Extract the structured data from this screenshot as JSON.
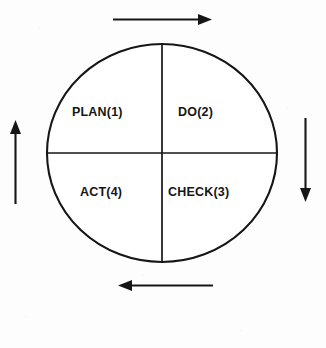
{
  "diagram": {
    "type": "pdca-cycle",
    "title": "",
    "shape": "ellipse",
    "rotation_direction": "clockwise",
    "stroke_color": "#161616",
    "fill_color": "#ffffff",
    "background_color": "#fdfdfd",
    "quadrants": [
      {
        "id": "plan",
        "label": "PLAN(1)",
        "step": 1,
        "position": "top-left"
      },
      {
        "id": "do",
        "label": "DO(2)",
        "step": 2,
        "position": "top-right"
      },
      {
        "id": "check",
        "label": "CHECK(3)",
        "step": 3,
        "position": "bottom-right"
      },
      {
        "id": "act",
        "label": "ACT(4)",
        "step": 4,
        "position": "bottom-left"
      }
    ],
    "arrows": [
      {
        "id": "top",
        "direction": "right",
        "position": "above-circle"
      },
      {
        "id": "right",
        "direction": "down",
        "position": "right-of-circle"
      },
      {
        "id": "bottom",
        "direction": "left",
        "position": "below-circle"
      },
      {
        "id": "left",
        "direction": "up",
        "position": "left-of-circle"
      }
    ]
  }
}
